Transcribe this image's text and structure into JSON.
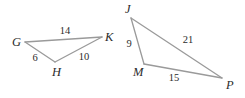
{
  "diagram": {
    "background_color": "#ffffff",
    "line_color": "#9a9a9a",
    "label_color": "#2b2b2b",
    "figures": [
      {
        "name": "triangle-ghk",
        "vertices": [
          {
            "label": "G",
            "x": 25,
            "y": 42,
            "label_x": 12,
            "label_y": 43
          },
          {
            "label": "K",
            "x": 102,
            "y": 37,
            "label_x": 105,
            "label_y": 38
          },
          {
            "label": "H",
            "x": 55,
            "y": 62,
            "label_x": 52,
            "label_y": 73
          }
        ],
        "sides": [
          {
            "name": "GK",
            "value": "14",
            "label_x": 65,
            "label_y": 32
          },
          {
            "name": "GH",
            "value": "6",
            "label_x": 35,
            "label_y": 59
          },
          {
            "name": "HK",
            "value": "10",
            "label_x": 84,
            "label_y": 58
          }
        ]
      },
      {
        "name": "triangle-jmp",
        "vertices": [
          {
            "label": "J",
            "x": 131,
            "y": 18,
            "label_x": 125,
            "label_y": 10
          },
          {
            "label": "M",
            "x": 144,
            "y": 64,
            "label_x": 133,
            "label_y": 73
          },
          {
            "label": "P",
            "x": 222,
            "y": 78,
            "label_x": 226,
            "label_y": 86
          }
        ],
        "sides": [
          {
            "name": "JM",
            "value": "9",
            "label_x": 129,
            "label_y": 45
          },
          {
            "name": "JP",
            "value": "21",
            "label_x": 188,
            "label_y": 41
          },
          {
            "name": "MP",
            "value": "15",
            "label_x": 174,
            "label_y": 79
          }
        ]
      }
    ]
  }
}
